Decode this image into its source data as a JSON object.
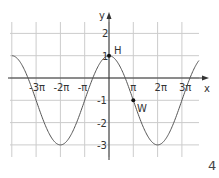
{
  "chart_data": {
    "type": "line",
    "function": "y = 2cos(x/2) - 1",
    "xlabel": "x",
    "ylabel": "y",
    "x_ticks": [
      "-3π",
      "-2π",
      "-π",
      "π",
      "2π",
      "3π"
    ],
    "y_ticks": [
      "-3",
      "-2",
      "-1",
      "1",
      "2"
    ],
    "xlim_pi": [
      -4,
      3.7
    ],
    "ylim": [
      -3.5,
      2.5
    ],
    "grid": true,
    "points": [
      {
        "name": "H",
        "x": "0",
        "y": 1
      },
      {
        "name": "W",
        "x": "π",
        "y": -1
      }
    ],
    "extrema": {
      "max": 1,
      "min": -3
    }
  },
  "page_number": "4",
  "colors": {
    "curve": "#555555",
    "grid": "#cccccc",
    "axis": "#333333"
  }
}
